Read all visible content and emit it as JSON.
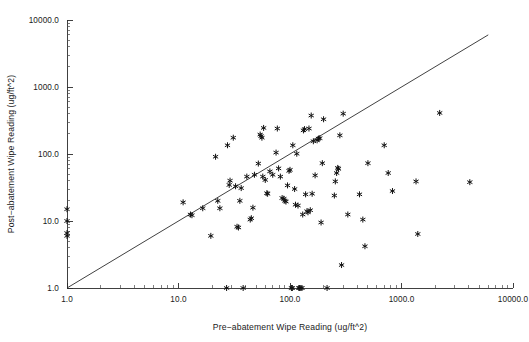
{
  "figure": {
    "background_color": "#ffffff",
    "foreground_color": "#1a1a1a",
    "marker_color": "#111111",
    "marker_symbol": "asterisk"
  },
  "chart_data": {
    "type": "scatter",
    "title": "",
    "xlabel": "Pre−abatement Wipe Reading (ug/ft^2)",
    "ylabel": "Post−abatement Wipe Reading (ug/ft^2)",
    "xscale": "log",
    "yscale": "log",
    "xlim": [
      1.0,
      10000.0
    ],
    "ylim": [
      1.0,
      10000.0
    ],
    "grid": false,
    "legend": null,
    "xticks": [
      1.0,
      10.0,
      100.0,
      1000.0,
      10000.0
    ],
    "xticklabels": [
      "1.0",
      "10.0",
      "100.0",
      "1000.0",
      "10000.0"
    ],
    "yticks": [
      1.0,
      10.0,
      100.0,
      1000.0,
      10000.0
    ],
    "yticklabels": [
      "1.0",
      "10.0",
      "100.0",
      "1000.0",
      "10000.0"
    ],
    "minor_ticks": true,
    "annotations": [
      {
        "name": "identity-reference-line",
        "type": "line",
        "description": "y = x diagonal reference line",
        "from": [
          1.0,
          1.0
        ],
        "to": [
          6000.0,
          6000.0
        ]
      }
    ],
    "series": [
      {
        "name": "wipe readings",
        "marker": "asterisk",
        "points": [
          [
            1.0,
            15.0
          ],
          [
            1.0,
            10.0
          ],
          [
            1.0,
            6.6
          ],
          [
            1.0,
            6.0
          ],
          [
            11.0,
            19.0
          ],
          [
            12.8,
            12.5
          ],
          [
            13.2,
            12.2
          ],
          [
            16.5,
            15.5
          ],
          [
            19.5,
            6.0
          ],
          [
            21.5,
            91.0
          ],
          [
            22.5,
            20.0
          ],
          [
            23.5,
            15.5
          ],
          [
            27.0,
            1.0
          ],
          [
            27.5,
            135.0
          ],
          [
            28.5,
            34.5
          ],
          [
            29.0,
            40.0
          ],
          [
            31.0,
            175.0
          ],
          [
            32.5,
            33.0
          ],
          [
            33.5,
            8.2
          ],
          [
            34.5,
            8.0
          ],
          [
            35.5,
            20.0
          ],
          [
            36.5,
            31.0
          ],
          [
            38.0,
            1.0
          ],
          [
            41.0,
            46.0
          ],
          [
            44.0,
            10.5
          ],
          [
            45.0,
            11.0
          ],
          [
            46.5,
            15.8
          ],
          [
            48.0,
            49.0
          ],
          [
            52.0,
            72.0
          ],
          [
            54.0,
            195.0
          ],
          [
            55.0,
            185.0
          ],
          [
            56.0,
            175.0
          ],
          [
            57.0,
            46.0
          ],
          [
            58.0,
            245.0
          ],
          [
            60.0,
            41.0
          ],
          [
            62.0,
            26.0
          ],
          [
            63.0,
            25.5
          ],
          [
            66.0,
            55.0
          ],
          [
            70.0,
            49.0
          ],
          [
            75.0,
            105.0
          ],
          [
            77.0,
            240.0
          ],
          [
            79.0,
            61.0
          ],
          [
            82.0,
            46.0
          ],
          [
            85.0,
            22.0
          ],
          [
            88.0,
            21.5
          ],
          [
            90.0,
            20.0
          ],
          [
            92.0,
            19.5
          ],
          [
            95.0,
            34.0
          ],
          [
            98.0,
            56.0
          ],
          [
            100.0,
            58.0
          ],
          [
            103.0,
            1.0
          ],
          [
            105.0,
            1.0
          ],
          [
            106.0,
            135.0
          ],
          [
            110.0,
            30.0
          ],
          [
            112.0,
            17.5
          ],
          [
            115.0,
            101.0
          ],
          [
            118.0,
            17.0
          ],
          [
            120.0,
            1.0
          ],
          [
            122.0,
            1.0
          ],
          [
            125.0,
            1.0
          ],
          [
            128.0,
            1.0
          ],
          [
            130.0,
            12.5
          ],
          [
            132.0,
            225.0
          ],
          [
            135.0,
            235.0
          ],
          [
            138.0,
            25.0
          ],
          [
            142.0,
            14.0
          ],
          [
            145.0,
            13.5
          ],
          [
            148.0,
            240.0
          ],
          [
            152.0,
            14.5
          ],
          [
            155.0,
            375.0
          ],
          [
            158.0,
            25.5
          ],
          [
            162.0,
            155.0
          ],
          [
            168.0,
            48.0
          ],
          [
            175.0,
            160.0
          ],
          [
            180.0,
            170.0
          ],
          [
            185.0,
            172.0
          ],
          [
            190.0,
            9.5
          ],
          [
            195.0,
            73.0
          ],
          [
            200.0,
            330.0
          ],
          [
            215.0,
            1.0
          ],
          [
            250.0,
            24.0
          ],
          [
            255.0,
            39.0
          ],
          [
            262.0,
            52.0
          ],
          [
            268.0,
            62.0
          ],
          [
            272.0,
            60.0
          ],
          [
            280.0,
            190.0
          ],
          [
            290.0,
            2.2
          ],
          [
            300.0,
            400.0
          ],
          [
            330.0,
            12.5
          ],
          [
            420.0,
            25.0
          ],
          [
            450.0,
            10.5
          ],
          [
            470.0,
            4.2
          ],
          [
            500.0,
            73.0
          ],
          [
            700.0,
            135.0
          ],
          [
            760.0,
            52.0
          ],
          [
            830.0,
            28.0
          ],
          [
            1350.0,
            39.0
          ],
          [
            1400.0,
            6.4
          ],
          [
            2200.0,
            410.0
          ],
          [
            4100.0,
            38.0
          ]
        ]
      }
    ]
  }
}
